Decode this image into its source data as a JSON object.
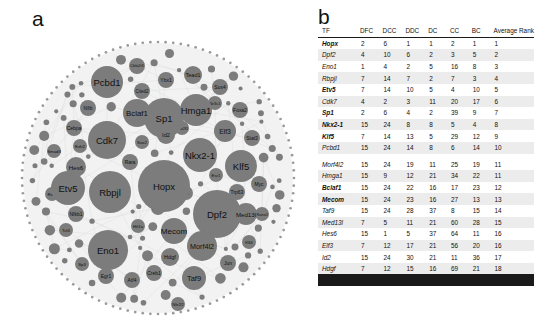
{
  "figure": {
    "panel_a_letter": "a",
    "panel_b_letter": "b"
  },
  "network": {
    "large_nodes": [
      {
        "label": "Hopx",
        "cx": 158,
        "cy": 168,
        "r": 26
      },
      {
        "label": "Dpf2",
        "cx": 211,
        "cy": 196,
        "r": 24
      },
      {
        "label": "Sp1",
        "cx": 158,
        "cy": 100,
        "r": 20
      },
      {
        "label": "Rbpjl",
        "cx": 104,
        "cy": 174,
        "r": 21
      },
      {
        "label": "Cdk7",
        "cx": 101,
        "cy": 122,
        "r": 19
      },
      {
        "label": "Eno1",
        "cx": 102,
        "cy": 232,
        "r": 20
      },
      {
        "label": "Etv5",
        "cx": 62,
        "cy": 170,
        "r": 17
      },
      {
        "label": "Nkx2-1",
        "cx": 194,
        "cy": 137,
        "r": 17
      },
      {
        "label": "Klf5",
        "cx": 235,
        "cy": 148,
        "r": 16
      },
      {
        "label": "Pcbd1",
        "cx": 101,
        "cy": 64,
        "r": 16
      },
      {
        "label": "Hmga1",
        "cx": 190,
        "cy": 92,
        "r": 16
      },
      {
        "label": "Bclaf1",
        "cx": 131,
        "cy": 95,
        "r": 14
      },
      {
        "label": "Morf4l2",
        "cx": 196,
        "cy": 228,
        "r": 15
      },
      {
        "label": "Mecom",
        "cx": 168,
        "cy": 213,
        "r": 13
      },
      {
        "label": "Taf9",
        "cx": 188,
        "cy": 260,
        "r": 12
      },
      {
        "label": "Med13l",
        "cx": 240,
        "cy": 196,
        "r": 11
      },
      {
        "label": "Elf3",
        "cx": 219,
        "cy": 113,
        "r": 11
      },
      {
        "label": "Hdgf",
        "cx": 164,
        "cy": 239,
        "r": 9
      },
      {
        "label": "Id2",
        "cx": 160,
        "cy": 117,
        "r": 9
      },
      {
        "label": "Hes6",
        "cx": 70,
        "cy": 149,
        "r": 10
      }
    ],
    "small_nodes": [
      {
        "label": "Cbfa2t3",
        "cx": 131,
        "cy": 48,
        "r": 8
      },
      {
        "label": "Cited2",
        "cx": 136,
        "cy": 73,
        "r": 8
      },
      {
        "label": "Tead1",
        "cx": 187,
        "cy": 57,
        "r": 9
      },
      {
        "label": "Ybx1",
        "cx": 160,
        "cy": 62,
        "r": 8
      },
      {
        "label": "Sox4",
        "cx": 214,
        "cy": 69,
        "r": 8
      },
      {
        "label": "Foxa2",
        "cx": 234,
        "cy": 92,
        "r": 8
      },
      {
        "label": "Nfib",
        "cx": 82,
        "cy": 90,
        "r": 8
      },
      {
        "label": "Cebpa",
        "cx": 68,
        "cy": 110,
        "r": 8
      },
      {
        "label": "Ezh2",
        "cx": 74,
        "cy": 128,
        "r": 7
      },
      {
        "label": "Smad3",
        "cx": 48,
        "cy": 133,
        "r": 7
      },
      {
        "label": "Rara",
        "cx": 124,
        "cy": 144,
        "r": 8
      },
      {
        "label": "Sox2",
        "cx": 136,
        "cy": 124,
        "r": 7
      },
      {
        "label": "Pou2f1",
        "cx": 176,
        "cy": 110,
        "r": 7
      },
      {
        "label": "Nr3c1",
        "cx": 209,
        "cy": 85,
        "r": 7
      },
      {
        "label": "Stat3",
        "cx": 246,
        "cy": 120,
        "r": 8
      },
      {
        "label": "Myc",
        "cx": 253,
        "cy": 166,
        "r": 8
      },
      {
        "label": "Trp63",
        "cx": 231,
        "cy": 174,
        "r": 8
      },
      {
        "label": "Runx1",
        "cx": 256,
        "cy": 196,
        "r": 7
      },
      {
        "label": "Jun",
        "cx": 222,
        "cy": 245,
        "r": 8
      },
      {
        "label": "Creb1",
        "cx": 148,
        "cy": 255,
        "r": 8
      },
      {
        "label": "Atf4",
        "cx": 126,
        "cy": 262,
        "r": 8
      },
      {
        "label": "Egr1",
        "cx": 100,
        "cy": 258,
        "r": 8
      },
      {
        "label": "Sp3",
        "cx": 76,
        "cy": 246,
        "r": 7
      },
      {
        "label": "Tcf4",
        "cx": 60,
        "cy": 212,
        "r": 7
      },
      {
        "label": "Nfkb1",
        "cx": 70,
        "cy": 196,
        "r": 8
      },
      {
        "label": "Rela",
        "cx": 46,
        "cy": 176,
        "r": 7
      },
      {
        "label": "Hif1a",
        "cx": 132,
        "cy": 208,
        "r": 7
      },
      {
        "label": "Gata6",
        "cx": 152,
        "cy": 190,
        "r": 7
      },
      {
        "label": "Srf",
        "cx": 180,
        "cy": 175,
        "r": 7
      },
      {
        "label": "Esr1",
        "cx": 210,
        "cy": 157,
        "r": 7
      },
      {
        "label": "Nfe2l2",
        "cx": 172,
        "cy": 286,
        "r": 7
      },
      {
        "label": "Klf4",
        "cx": 243,
        "cy": 224,
        "r": 7
      }
    ]
  },
  "table": {
    "columns": [
      "TF",
      "DFC",
      "DCC",
      "DDC",
      "DC",
      "CC",
      "BC",
      "Average Rank"
    ],
    "rows": [
      {
        "tf": "Hopx",
        "bold": true,
        "dfc": "2",
        "dcc": "6",
        "ddc": "1",
        "dc": "1",
        "cc": "2",
        "bc": "1",
        "avg": "1"
      },
      {
        "tf": "Dpf2",
        "bold": false,
        "dfc": "4",
        "dcc": "10",
        "ddc": "6",
        "dc": "2",
        "cc": "3",
        "bc": "5",
        "avg": "2"
      },
      {
        "tf": "Eno1",
        "bold": false,
        "dfc": "1",
        "dcc": "4",
        "ddc": "2",
        "dc": "5",
        "cc": "16",
        "bc": "8",
        "avg": "3"
      },
      {
        "tf": "Rbpjl",
        "bold": false,
        "dfc": "7",
        "dcc": "14",
        "ddc": "7",
        "dc": "2",
        "cc": "7",
        "bc": "3",
        "avg": "4"
      },
      {
        "tf": "Etv5",
        "bold": true,
        "dfc": "7",
        "dcc": "14",
        "ddc": "10",
        "dc": "5",
        "cc": "4",
        "bc": "10",
        "avg": "5"
      },
      {
        "tf": "Cdk7",
        "bold": false,
        "dfc": "4",
        "dcc": "2",
        "ddc": "3",
        "dc": "11",
        "cc": "20",
        "bc": "17",
        "avg": "6"
      },
      {
        "tf": "Sp1",
        "bold": true,
        "dfc": "2",
        "dcc": "6",
        "ddc": "4",
        "dc": "2",
        "cc": "39",
        "bc": "9",
        "avg": "7"
      },
      {
        "tf": "Nkx2-1",
        "bold": true,
        "dfc": "15",
        "dcc": "24",
        "ddc": "8",
        "dc": "8",
        "cc": "5",
        "bc": "4",
        "avg": "8"
      },
      {
        "tf": "Klf5",
        "bold": true,
        "dfc": "7",
        "dcc": "14",
        "ddc": "13",
        "dc": "5",
        "cc": "29",
        "bc": "12",
        "avg": "9"
      },
      {
        "tf": "Pcbd1",
        "bold": false,
        "dfc": "15",
        "dcc": "24",
        "ddc": "14",
        "dc": "8",
        "cc": "6",
        "bc": "14",
        "avg": "10"
      },
      {
        "tf": "Morf4l2",
        "bold": false,
        "dfc": "15",
        "dcc": "24",
        "ddc": "19",
        "dc": "11",
        "cc": "25",
        "bc": "19",
        "avg": "11"
      },
      {
        "tf": "Hmga1",
        "bold": false,
        "dfc": "15",
        "dcc": "9",
        "ddc": "12",
        "dc": "21",
        "cc": "34",
        "bc": "22",
        "avg": "11"
      },
      {
        "tf": "Bclaf1",
        "bold": true,
        "dfc": "15",
        "dcc": "24",
        "ddc": "22",
        "dc": "16",
        "cc": "17",
        "bc": "23",
        "avg": "12"
      },
      {
        "tf": "Mecom",
        "bold": true,
        "dfc": "15",
        "dcc": "24",
        "ddc": "23",
        "dc": "16",
        "cc": "27",
        "bc": "13",
        "avg": "13"
      },
      {
        "tf": "Taf9",
        "bold": false,
        "dfc": "15",
        "dcc": "24",
        "ddc": "28",
        "dc": "37",
        "cc": "8",
        "bc": "15",
        "avg": "14"
      },
      {
        "tf": "Med13l",
        "bold": false,
        "dfc": "7",
        "dcc": "5",
        "ddc": "11",
        "dc": "21",
        "cc": "60",
        "bc": "28",
        "avg": "15"
      },
      {
        "tf": "Hes6",
        "bold": false,
        "dfc": "15",
        "dcc": "1",
        "ddc": "5",
        "dc": "37",
        "cc": "64",
        "bc": "11",
        "avg": "16"
      },
      {
        "tf": "Elf3",
        "bold": false,
        "dfc": "7",
        "dcc": "12",
        "ddc": "17",
        "dc": "21",
        "cc": "56",
        "bc": "20",
        "avg": "16"
      },
      {
        "tf": "Id2",
        "bold": false,
        "dfc": "15",
        "dcc": "24",
        "ddc": "30",
        "dc": "21",
        "cc": "11",
        "bc": "36",
        "avg": "17"
      },
      {
        "tf": "Hdgf",
        "bold": false,
        "dfc": "7",
        "dcc": "12",
        "ddc": "15",
        "dc": "16",
        "cc": "69",
        "bc": "21",
        "avg": "18"
      }
    ]
  },
  "colors": {
    "node_fill": "#7c7c7c",
    "disc_fill": "#f2f2f2",
    "edge": "#d8d8d8",
    "ring": "#9a9a9a",
    "stripe": "#ececec",
    "rule": "#1a1a1a"
  }
}
